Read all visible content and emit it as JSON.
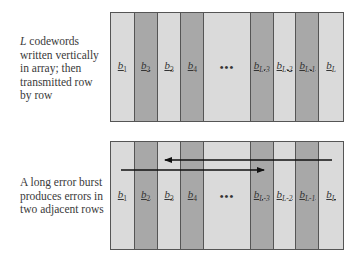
{
  "top_panel": {
    "caption_italic": "L",
    "caption_rest": " codewords written vertically in array; then transmitted row by row",
    "columns": [
      {
        "type": "light",
        "base": "b",
        "sub": "1",
        "width": 24
      },
      {
        "type": "dark",
        "base": "b",
        "sub": "2",
        "width": 23
      },
      {
        "type": "light",
        "base": "b",
        "sub": "3",
        "width": 24
      },
      {
        "type": "dark",
        "base": "b",
        "sub": "4",
        "width": 23
      },
      {
        "type": "light",
        "base": "",
        "sub": "",
        "ellipsis": "•••",
        "width": 47
      },
      {
        "type": "dark",
        "base": "b",
        "sub": "L-3",
        "width": 23
      },
      {
        "type": "light",
        "base": "b",
        "sub": "L-2",
        "width": 23
      },
      {
        "type": "dark",
        "base": "b",
        "sub": "L-1",
        "width": 23
      },
      {
        "type": "light",
        "base": "b",
        "sub": "L",
        "width": 24
      }
    ]
  },
  "bottom_panel": {
    "caption": "A long error burst produces errors in two adjacent rows",
    "columns": [
      {
        "type": "light",
        "base": "b",
        "sub": "1",
        "width": 24
      },
      {
        "type": "dark",
        "base": "b",
        "sub": "2",
        "width": 23
      },
      {
        "type": "light",
        "base": "b",
        "sub": "3",
        "width": 24
      },
      {
        "type": "dark",
        "base": "b",
        "sub": "4",
        "width": 23
      },
      {
        "type": "light",
        "base": "",
        "sub": "",
        "ellipsis": "•••",
        "width": 47
      },
      {
        "type": "dark",
        "base": "b",
        "sub": "L-3",
        "width": 23
      },
      {
        "type": "light",
        "base": "b",
        "sub": "L-2",
        "width": 23
      },
      {
        "type": "dark",
        "base": "b",
        "sub": "L-1",
        "width": 23
      },
      {
        "type": "light",
        "base": "b",
        "sub": "L",
        "width": 24
      }
    ],
    "arrows": [
      {
        "name": "burst-row-1",
        "x1": 332,
        "x2": 165,
        "y": 160,
        "direction": "left"
      },
      {
        "name": "burst-row-2",
        "x1": 121,
        "x2": 264,
        "y": 170,
        "direction": "right"
      }
    ]
  },
  "colors": {
    "light_column": "#dadada",
    "dark_column": "#a8a8a8",
    "border": "#555555",
    "arrow": "#111111"
  }
}
